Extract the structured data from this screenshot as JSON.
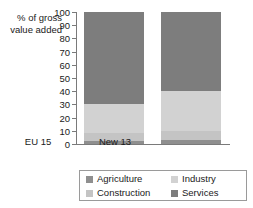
{
  "chart_data": {
    "type": "bar",
    "subtype": "stacked-100-percent",
    "title": "",
    "xlabel": "",
    "ylabel": "% of gross\nvalue added",
    "ylim": [
      0,
      100
    ],
    "yticks": [
      0,
      10,
      20,
      30,
      40,
      50,
      60,
      70,
      80,
      90,
      100
    ],
    "ytick_labels": [
      "0",
      "10",
      "20",
      "30",
      "40",
      "50",
      "60",
      "70",
      "80",
      "90",
      "100"
    ],
    "grid": false,
    "legend_position": "bottom",
    "categories": [
      "EU 15",
      "New 13"
    ],
    "series": [
      {
        "name": "Agriculture",
        "values": [
          2,
          3
        ],
        "color": "#8f8f8f"
      },
      {
        "name": "Construction",
        "values": [
          6,
          7
        ],
        "color": "#c4c4c4"
      },
      {
        "name": "Industry",
        "values": [
          22,
          30
        ],
        "color": "#d2d2d2"
      },
      {
        "name": "Services",
        "values": [
          70,
          60
        ],
        "color": "#7d7d7d"
      }
    ]
  },
  "axis": {
    "y_title": "% of gross\nvalue added",
    "ticks": [
      "100",
      "90",
      "80",
      "70",
      "60",
      "50",
      "40",
      "30",
      "20",
      "10",
      "0"
    ]
  },
  "categories": {
    "c0": "EU 15",
    "c1": "New 13"
  },
  "legend": {
    "items": [
      {
        "label": "Agriculture",
        "color": "#8f8f8f"
      },
      {
        "label": "Industry",
        "color": "#d2d2d2"
      },
      {
        "label": "Construction",
        "color": "#c4c4c4"
      },
      {
        "label": "Services",
        "color": "#7d7d7d"
      }
    ]
  },
  "colors": {
    "axis": "#7a7a7a",
    "text": "#1a1a1a",
    "legend_border": "#9a9a9a",
    "background": "#ffffff"
  }
}
